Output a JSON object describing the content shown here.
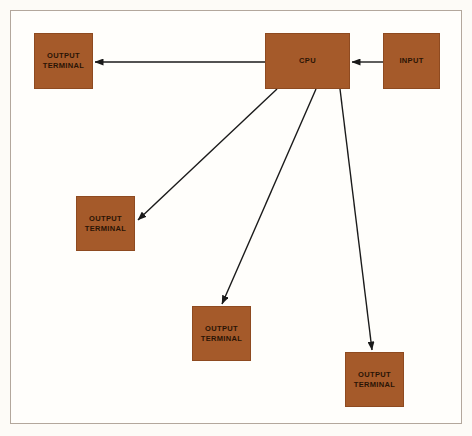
{
  "diagram": {
    "background_color": "#fdfbf7",
    "frame_color": "#b3a79c",
    "node_fill": "#a55a2a",
    "node_border": "#8e4a20",
    "node_text_color": "#2a1405",
    "arrow_color": "#1a1a1a",
    "nodes": [
      {
        "id": "output-terminal-top-left",
        "label": "OUTPUT\nTERMINAL",
        "x": 34,
        "y": 33,
        "w": 59,
        "h": 56
      },
      {
        "id": "cpu",
        "label": "CPU",
        "x": 265,
        "y": 33,
        "w": 85,
        "h": 56
      },
      {
        "id": "input",
        "label": "INPUT",
        "x": 383,
        "y": 33,
        "w": 57,
        "h": 56
      },
      {
        "id": "output-terminal-left",
        "label": "OUTPUT\nTERMINAL",
        "x": 76,
        "y": 196,
        "w": 59,
        "h": 55
      },
      {
        "id": "output-terminal-center",
        "label": "OUTPUT\nTERMINAL",
        "x": 192,
        "y": 306,
        "w": 59,
        "h": 55
      },
      {
        "id": "output-terminal-right",
        "label": "OUTPUT\nTERMINAL",
        "x": 345,
        "y": 352,
        "w": 59,
        "h": 55
      }
    ],
    "arrows": [
      {
        "id": "arrow-cpu-to-output-top-left",
        "from": "cpu",
        "to": "output-terminal-top-left",
        "x1": 265,
        "y1": 62,
        "x2": 95,
        "y2": 62
      },
      {
        "id": "arrow-input-to-cpu",
        "from": "input",
        "to": "cpu",
        "x1": 383,
        "y1": 62,
        "x2": 352,
        "y2": 62
      },
      {
        "id": "arrow-cpu-to-output-left",
        "from": "cpu",
        "to": "output-terminal-left",
        "x1": 277,
        "y1": 89,
        "x2": 138,
        "y2": 220
      },
      {
        "id": "arrow-cpu-to-output-center",
        "from": "cpu",
        "to": "output-terminal-center",
        "x1": 316,
        "y1": 89,
        "x2": 222,
        "y2": 304
      },
      {
        "id": "arrow-cpu-to-output-right",
        "from": "cpu",
        "to": "output-terminal-right",
        "x1": 340,
        "y1": 89,
        "x2": 372,
        "y2": 350
      }
    ]
  }
}
